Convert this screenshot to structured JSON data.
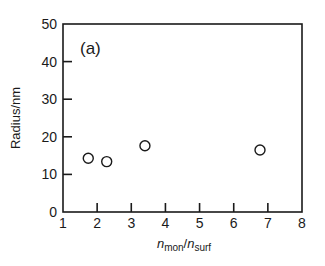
{
  "chart_data": {
    "type": "scatter",
    "title": "",
    "panel_label": "(a)",
    "xlabel": "n_mon/n_surf",
    "xlabel_parts": {
      "main1": "n",
      "sub1": "mon",
      "sep": "/",
      "main2": "n",
      "sub2": "surf"
    },
    "ylabel": "Radius/nm",
    "xlim": [
      1,
      8
    ],
    "ylim": [
      0,
      50
    ],
    "xticks": [
      1,
      2,
      3,
      4,
      5,
      6,
      7,
      8
    ],
    "yticks": [
      0,
      10,
      20,
      30,
      40,
      50
    ],
    "grid": false,
    "legend": null,
    "marker": "open-circle",
    "series": [
      {
        "name": "Radius",
        "points": [
          {
            "x": 1.74,
            "y": 14.3
          },
          {
            "x": 2.28,
            "y": 13.4
          },
          {
            "x": 3.4,
            "y": 17.6
          },
          {
            "x": 6.77,
            "y": 16.5
          }
        ]
      }
    ]
  },
  "colors": {
    "axis": "#1a1a1a",
    "marker_stroke": "#1a1a1a",
    "background": "#ffffff"
  }
}
